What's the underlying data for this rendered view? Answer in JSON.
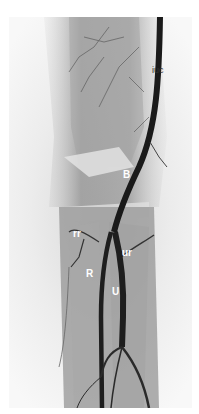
{
  "figure": {
    "labels": {
      "iuc": "iuc",
      "B": "B",
      "rr": "rr",
      "ur": "ur",
      "R": "R",
      "U": "U"
    }
  }
}
